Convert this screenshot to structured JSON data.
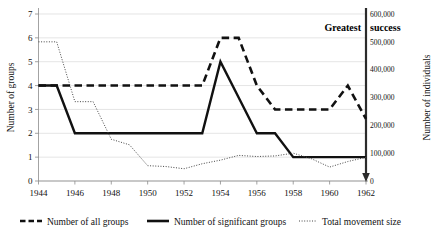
{
  "chart_data": {
    "type": "line",
    "title": "",
    "xlabel": "",
    "ylabel": "Number of groups",
    "y2label": "Number of individuals",
    "xlim": [
      1944,
      1962
    ],
    "ylim": [
      0,
      7
    ],
    "y2lim": [
      0,
      600000
    ],
    "grid": true,
    "legend_position": "bottom",
    "x": [
      1944,
      1945,
      1946,
      1947,
      1948,
      1949,
      1950,
      1951,
      1952,
      1953,
      1954,
      1955,
      1956,
      1957,
      1958,
      1959,
      1960,
      1961,
      1962
    ],
    "series": [
      {
        "name": "Number of all groups",
        "axis": "left",
        "style": "thick-dashed",
        "values": [
          4,
          4,
          4,
          4,
          4,
          4,
          4,
          4,
          4,
          4,
          6,
          6,
          4,
          3,
          3,
          3,
          3,
          4,
          2.6
        ]
      },
      {
        "name": "Number of significant groups",
        "axis": "left",
        "style": "thick-solid",
        "values": [
          4,
          4,
          2,
          2,
          2,
          2,
          2,
          2,
          2,
          2,
          5,
          3.5,
          2,
          2,
          1,
          1,
          1,
          1,
          1
        ]
      },
      {
        "name": "Total movement size",
        "axis": "right",
        "style": "dotted",
        "values": [
          500000,
          500000,
          285000,
          285000,
          150000,
          130000,
          55000,
          52000,
          44000,
          62000,
          75000,
          92000,
          88000,
          90000,
          100000,
          80000,
          50000,
          70000,
          85000
        ]
      }
    ],
    "x_ticks": [
      "1944",
      "1946",
      "1948",
      "1950",
      "1952",
      "1954",
      "1956",
      "1958",
      "1960",
      "1962"
    ],
    "y_ticks": [
      "0",
      "1",
      "2",
      "3",
      "4",
      "5",
      "6",
      "7"
    ],
    "y2_ticks": [
      "0",
      "100,000",
      "200,000",
      "300,000",
      "400,000",
      "500,000",
      "600,000"
    ],
    "annotations": [
      {
        "text": "Greatest",
        "position": "above-right-axis-left-side"
      },
      {
        "text": "success",
        "position": "above-right-axis-right-side"
      }
    ],
    "colors": {
      "series_line": "#111111",
      "dotted_line": "#444444",
      "gridline": "#d9d9d9",
      "axis": "#8c8c8c",
      "right_axis": "#2b2b2b",
      "background": "#ffffff"
    }
  },
  "legend": {
    "items": [
      {
        "label": "Number of all groups",
        "style": "thick-dashed"
      },
      {
        "label": "Number of significant groups",
        "style": "thick-solid"
      },
      {
        "label": "Total movement size",
        "style": "dotted"
      }
    ]
  },
  "axis_titles": {
    "left": "Number of groups",
    "right": "Number of individuals"
  }
}
